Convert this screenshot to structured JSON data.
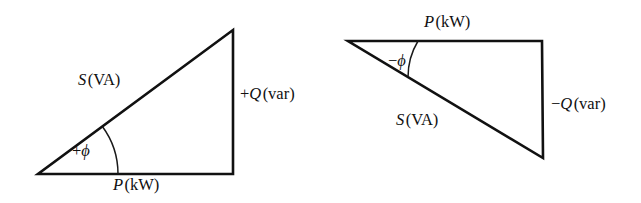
{
  "figure": {
    "name": "power-triangle-pair",
    "background_color": "#ffffff",
    "line_color": "#111111",
    "text_color": "#101010"
  },
  "triangles": [
    {
      "id": "lagging",
      "name": "inductive-lagging-power-triangle",
      "vertices": {
        "origin": [
          38,
          174
        ],
        "right_angle": [
          233,
          174
        ],
        "apex": [
          233,
          30
        ]
      },
      "labels": {
        "hypotenuse": {
          "symbol": "S",
          "unit": "(VA)",
          "sign": "",
          "x": 78,
          "y": 72
        },
        "vertical": {
          "symbol": "Q",
          "unit": "(var)",
          "sign": "+",
          "x": 240,
          "y": 86
        },
        "horizontal": {
          "symbol": "P",
          "unit": "(kW)",
          "sign": "",
          "x": 113,
          "y": 177
        },
        "angle": {
          "symbol": "ϕ",
          "sign": "+",
          "x": 72,
          "y": 143
        }
      },
      "arc": {
        "center": [
          38,
          174
        ],
        "radius": 80,
        "start_deg": 0,
        "end_deg": 36.4
      }
    },
    {
      "id": "leading",
      "name": "capacitive-leading-power-triangle",
      "vertices": {
        "origin": [
          348,
          41
        ],
        "right_angle": [
          542,
          41
        ],
        "apex": [
          543,
          158
        ]
      },
      "labels": {
        "hypotenuse": {
          "symbol": "S",
          "unit": "(VA)",
          "sign": "",
          "x": 396,
          "y": 112
        },
        "vertical": {
          "symbol": "Q",
          "unit": "(var)",
          "sign": "−",
          "x": 551,
          "y": 96
        },
        "horizontal": {
          "symbol": "P",
          "unit": "(kW)",
          "sign": "",
          "x": 424,
          "y": 14
        },
        "angle": {
          "symbol": "ϕ",
          "sign": "−",
          "x": 388,
          "y": 53
        }
      },
      "arc": {
        "center": [
          348,
          41
        ],
        "radius": 70,
        "start_deg": 0,
        "end_deg": -31.1
      }
    }
  ]
}
